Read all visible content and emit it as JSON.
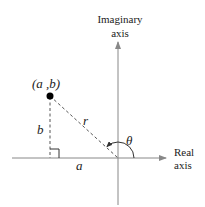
{
  "diagram": {
    "type": "complex-plane-polar-form",
    "axes": {
      "vertical_label_line1": "Imaginary",
      "vertical_label_line2": "axis",
      "horizontal_label_line1": "Real",
      "horizontal_label_line2": "axis"
    },
    "point": {
      "label": "(a ,b)"
    },
    "segments": {
      "horizontal_label": "a",
      "vertical_label": "b",
      "hypotenuse_label": "r"
    },
    "angle": {
      "label": "θ"
    },
    "colors": {
      "axis": "#888888",
      "dashed": "#555555",
      "point": "#000000",
      "text": "#222222"
    }
  }
}
